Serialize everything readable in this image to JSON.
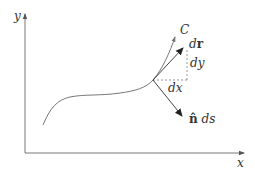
{
  "diagram": {
    "title": "",
    "axes": {
      "x_label": "x",
      "y_label": "y"
    },
    "curve_label": "C",
    "vectors": {
      "tangent_d": "d",
      "tangent_r": "r",
      "normal_n": "n̂",
      "normal_ds": " ds"
    },
    "components": {
      "dx": "dx",
      "dy": "dy"
    },
    "colors": {
      "line": "#555555",
      "curve": "#666666",
      "dashed": "#888888",
      "text": "#333333"
    }
  }
}
